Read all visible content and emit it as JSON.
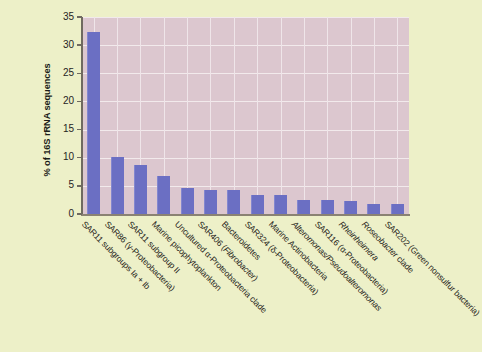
{
  "chart_data": {
    "type": "bar",
    "title": "",
    "xlabel": "",
    "ylabel": "% of 16S rRNA sequences",
    "ylim": [
      0,
      35
    ],
    "ytick_labels": [
      "0",
      "5",
      "10",
      "15",
      "20",
      "25",
      "30",
      "35"
    ],
    "ytick_values": [
      0,
      5,
      10,
      15,
      20,
      25,
      30,
      35
    ],
    "grid": true,
    "legend": "none",
    "bar_color": "#6b6fc3",
    "plot_background": "#dcc7cf",
    "page_background": "#edf0c8",
    "gridline_color": "#f2eaec",
    "categories": [
      "SAR11 subgroups Ia + Ib",
      "SAR86 (γ-Proteobacteria)",
      "SAR11 subgroup II",
      "Marine picophytoplankton",
      "Uncultured α-Proteobacteria clade",
      "SAR406 (Fibrobacter)",
      "Bacteroidetes",
      "SAR324 (δ-Proteobacteria)",
      "Marine Actinobacteria",
      "Alteromonas/Pseudoalteromonas",
      "SAR116 (α-Proteobacteria)",
      "Rheinheimera",
      "Roseobacter clade",
      "SAR202 (Green nonsulfur bacteria)"
    ],
    "values": [
      32.3,
      10.1,
      8.7,
      6.8,
      4.6,
      4.3,
      4.2,
      3.3,
      3.3,
      2.5,
      2.4,
      2.3,
      1.8,
      1.8
    ]
  },
  "axis": {
    "y_title": "% of 16S rRNA sequences"
  },
  "x_labels": [
    {
      "pre": "SAR11 subgroups Ia + Ib",
      "italic": "",
      "post": ""
    },
    {
      "pre": "SAR86 (γ-Proteobacteria)",
      "italic": "",
      "post": ""
    },
    {
      "pre": "SAR11 subgroup II",
      "italic": "",
      "post": ""
    },
    {
      "pre": "Marine picophytoplankton",
      "italic": "",
      "post": ""
    },
    {
      "pre": "Uncultured α-Proteobacteria clade",
      "italic": "",
      "post": ""
    },
    {
      "pre": "SAR406 (",
      "italic": "Fibrobacter",
      "post": ")"
    },
    {
      "pre": "Bacteroidetes",
      "italic": "",
      "post": ""
    },
    {
      "pre": "SAR324 (δ-Proteobacteria)",
      "italic": "",
      "post": ""
    },
    {
      "pre": "Marine Actinobacteria",
      "italic": "",
      "post": ""
    },
    {
      "pre": "",
      "italic": "Alteromonas/Pseudoalteromonas",
      "post": ""
    },
    {
      "pre": "SAR116 (α-Proteobacteria)",
      "italic": "",
      "post": ""
    },
    {
      "pre": "",
      "italic": "Rheinheimera",
      "post": ""
    },
    {
      "pre": "",
      "italic": "Roseobacter",
      "post": " clade"
    },
    {
      "pre": "SAR202 (Green nonsulfur bacteria)",
      "italic": "",
      "post": ""
    }
  ]
}
